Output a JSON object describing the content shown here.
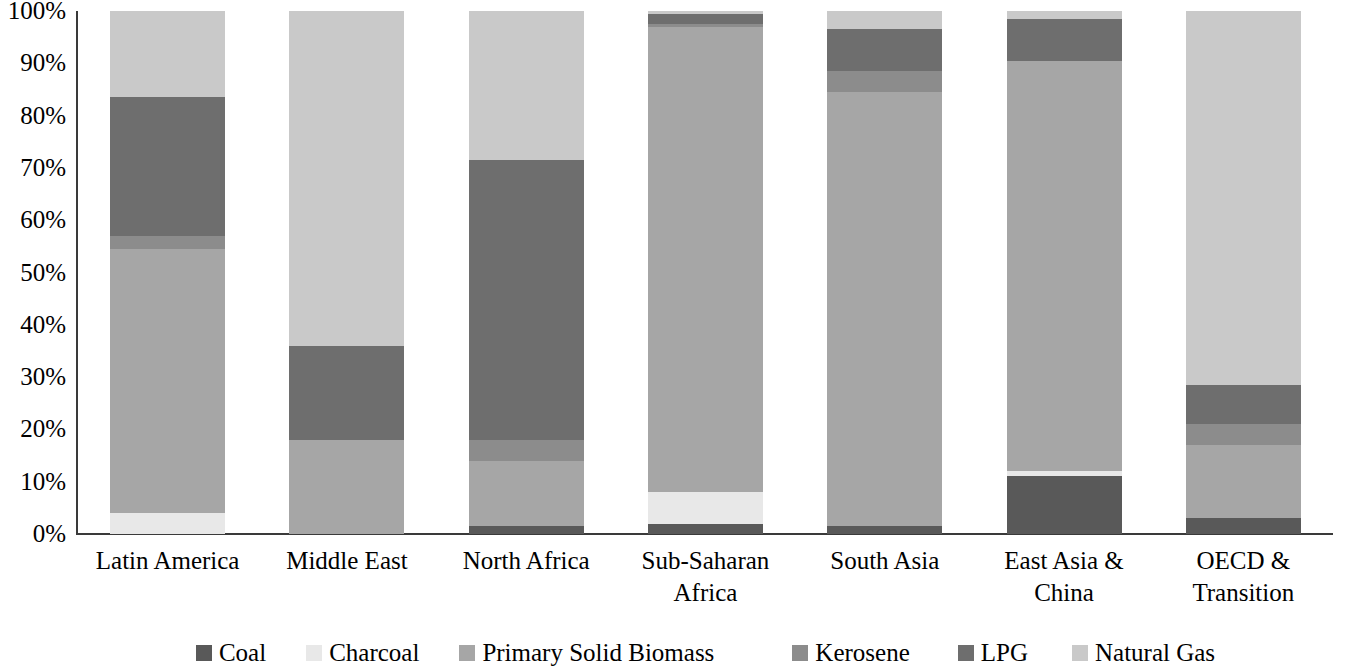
{
  "chart_data": {
    "type": "bar",
    "title": "",
    "subtitle": "",
    "xlabel": "",
    "ylabel": "",
    "stacked": true,
    "stack_total": 100,
    "ylim": [
      0,
      100
    ],
    "grid": false,
    "legend_position": "bottom",
    "y_tick_labels": [
      "100%",
      "90%",
      "80%",
      "70%",
      "60%",
      "50%",
      "40%",
      "30%",
      "20%",
      "10%",
      "0%"
    ],
    "y_ticks": [
      100,
      90,
      80,
      70,
      60,
      50,
      40,
      30,
      20,
      10,
      0
    ],
    "categories": [
      "Latin America",
      "Middle East",
      "North Africa",
      "Sub-Saharan\nAfrica",
      "South Asia",
      "East Asia  &\nChina",
      "OECD &\nTransition"
    ],
    "series": [
      {
        "name": "Coal",
        "color": "#595959",
        "values": [
          0.0,
          0.0,
          1.5,
          2.0,
          1.5,
          11.0,
          3.0
        ]
      },
      {
        "name": "Charcoal",
        "color": "#e8e8e8",
        "values": [
          4.0,
          0.0,
          0.0,
          6.0,
          0.0,
          1.0,
          0.0
        ]
      },
      {
        "name": "Primary Solid Biomass",
        "color": "#a6a6a6",
        "values": [
          50.5,
          18.0,
          12.5,
          89.0,
          83.0,
          78.5,
          14.0
        ]
      },
      {
        "name": "Kerosene",
        "color": "#8c8c8c",
        "values": [
          2.5,
          0.0,
          4.0,
          0.5,
          4.0,
          0.0,
          4.0
        ]
      },
      {
        "name": "LPG",
        "color": "#6e6e6e",
        "values": [
          26.5,
          18.0,
          53.5,
          2.0,
          8.0,
          8.0,
          7.5
        ]
      },
      {
        "name": "Natural Gas",
        "color": "#c9c9c9",
        "values": [
          16.5,
          64.0,
          28.5,
          0.5,
          3.5,
          1.5,
          71.5
        ]
      }
    ],
    "legend": [
      {
        "label": "Coal",
        "color": "#595959"
      },
      {
        "label": "Charcoal",
        "color": "#e8e8e8"
      },
      {
        "label": "Primary Solid Biomass",
        "color": "#a6a6a6"
      },
      {
        "label": "Kerosene",
        "color": "#8c8c8c"
      },
      {
        "label": "LPG",
        "color": "#6e6e6e"
      },
      {
        "label": "Natural Gas",
        "color": "#c9c9c9"
      }
    ]
  },
  "axis": {
    "line_color": "#3a3a3a"
  }
}
